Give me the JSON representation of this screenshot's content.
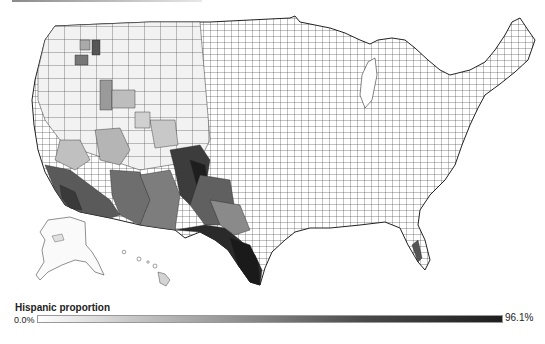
{
  "map": {
    "subject": "US counties choropleth",
    "variable": "Hispanic proportion",
    "regions_shown": [
      "Contiguous United States",
      "Alaska",
      "Hawaii"
    ],
    "color_scale": {
      "low": "#ffffff",
      "high": "#1e1e1e"
    }
  },
  "legend": {
    "title": "Hispanic proportion",
    "min_label": "0.0%",
    "max_label": "96.1%",
    "min_value": 0.0,
    "max_value": 96.1
  }
}
